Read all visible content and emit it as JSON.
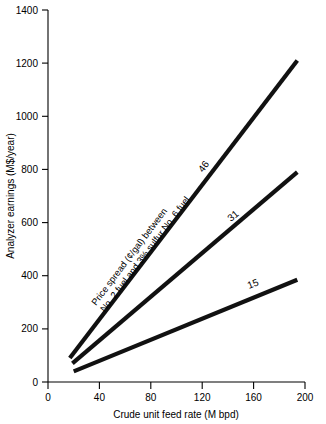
{
  "chart_data": {
    "type": "line",
    "title": "",
    "xlabel": "Crude unit feed rate  (M bpd)",
    "ylabel": "Analyzer earnings (M$/year)",
    "xlim": [
      0,
      200
    ],
    "ylim": [
      0,
      1400
    ],
    "xticks": [
      "0",
      "40",
      "80",
      "120",
      "160",
      "200"
    ],
    "xtick_values": [
      0,
      40,
      80,
      120,
      160,
      200
    ],
    "yticks": [
      "0",
      "200",
      "400",
      "600",
      "800",
      "1000",
      "1200",
      "1400"
    ],
    "ytick_values": [
      0,
      200,
      400,
      600,
      800,
      1000,
      1200,
      1400
    ],
    "grid": false,
    "legend": "inline-labels",
    "annotations": [
      {
        "name": "price-spread-note",
        "line1": "Price spread (¢/gal) between",
        "line2": "No. 2 fuel and 3% sulfur No. 6 fuel"
      }
    ],
    "series": [
      {
        "name": "46",
        "label": "46",
        "x": [
          17,
          194
        ],
        "values": [
          90,
          1210
        ]
      },
      {
        "name": "31",
        "label": "31",
        "x": [
          19,
          194
        ],
        "values": [
          70,
          790
        ]
      },
      {
        "name": "15",
        "label": "15",
        "x": [
          20,
          194
        ],
        "values": [
          40,
          385
        ]
      }
    ]
  }
}
